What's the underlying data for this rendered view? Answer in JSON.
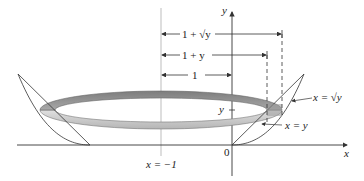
{
  "figure": {
    "axes": {
      "x_label": "x",
      "y_label": "y",
      "origin_label": "0"
    },
    "axis_of_rotation_label": "x = −1",
    "dimensions": [
      {
        "id": "outer_radius",
        "label": "1 + √y"
      },
      {
        "id": "inner_radius",
        "label": "1 + y"
      },
      {
        "id": "offset",
        "label": "1"
      }
    ],
    "curves": [
      {
        "id": "sqrt_curve",
        "label": "x = √y"
      },
      {
        "id": "line_curve",
        "label": "x = y"
      }
    ],
    "y_tick_label": "y",
    "colors": {
      "ring_dark": "#8a8a8a",
      "ring_light": "#cfcfcf",
      "line": "#333333",
      "axis_rotation": "#bbbbbb"
    }
  }
}
